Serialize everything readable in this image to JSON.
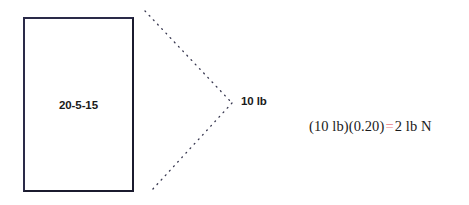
{
  "figure": {
    "block": {
      "label": "20-5-15"
    },
    "force": {
      "label": "10 lb"
    },
    "equation": {
      "lhs": "(10 lb)(0.20)",
      "operator": "=",
      "rhs": "2 lb N",
      "operator_color": "#e87b84"
    },
    "arrow": {
      "name": "dotted-chevron",
      "upper_start": {
        "x": 145,
        "y": 11
      },
      "vertex": {
        "x": 232,
        "y": 103
      },
      "lower_end": {
        "x": 152,
        "y": 190
      }
    },
    "colors": {
      "background": "#ffffff",
      "ink": "#1a1a1a",
      "block_border": "#1b1b2e",
      "dot": "#3a3a52"
    }
  }
}
